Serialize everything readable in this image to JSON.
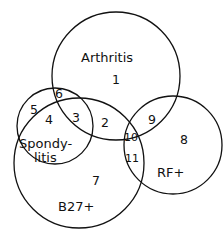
{
  "diagram": {
    "type": "venn",
    "sets": [
      {
        "id": "arthritis",
        "label": "Arthritis"
      },
      {
        "id": "spondylitis",
        "label_line1": "Spondy-",
        "label_line2": "litis"
      },
      {
        "id": "b27",
        "label": "B27+"
      },
      {
        "id": "rf",
        "label": "RF+"
      }
    ],
    "regions": [
      "1",
      "2",
      "3",
      "4",
      "5",
      "6",
      "7",
      "8",
      "9",
      "10",
      "11"
    ]
  }
}
